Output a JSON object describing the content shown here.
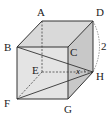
{
  "figure": {
    "type": "cube",
    "vertices": {
      "A": {
        "label": "A",
        "x": 42,
        "y": 21
      },
      "B": {
        "label": "B",
        "x": 17,
        "y": 47
      },
      "C": {
        "label": "C",
        "x": 68,
        "y": 47
      },
      "D": {
        "label": "D",
        "x": 93,
        "y": 21
      },
      "E": {
        "label": "E",
        "x": 42,
        "y": 72
      },
      "F": {
        "label": "F",
        "x": 17,
        "y": 99
      },
      "G": {
        "label": "G",
        "x": 68,
        "y": 99
      },
      "H": {
        "label": "H",
        "x": 93,
        "y": 72
      }
    },
    "edge_length_label": "2",
    "edge_length_edge": "DH",
    "angle_label": "x",
    "angle_at": "H",
    "angle_between": [
      "EH",
      "BH"
    ],
    "diagonals": [
      "BH",
      "FH"
    ],
    "hidden_edges": [
      "AE",
      "EF",
      "EH"
    ],
    "colors": {
      "line": "#333333",
      "face_light": "#e6e6e6",
      "face_mid": "#d2d2d2",
      "face_dark": "#bdbdbd"
    }
  }
}
